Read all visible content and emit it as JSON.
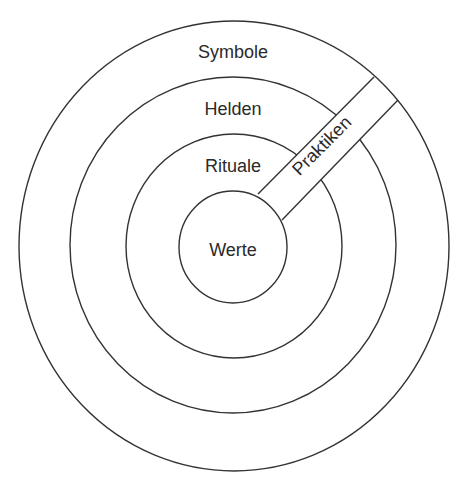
{
  "diagram": {
    "type": "onion-model",
    "layers": [
      {
        "id": "symbole",
        "label": "Symbole"
      },
      {
        "id": "helden",
        "label": "Helden"
      },
      {
        "id": "rituale",
        "label": "Rituale"
      },
      {
        "id": "werte",
        "label": "Werte"
      }
    ],
    "band": {
      "label": "Praktiken"
    },
    "colors": {
      "stroke": "#333333",
      "text": "#2a2a2a",
      "background": "#ffffff"
    }
  }
}
